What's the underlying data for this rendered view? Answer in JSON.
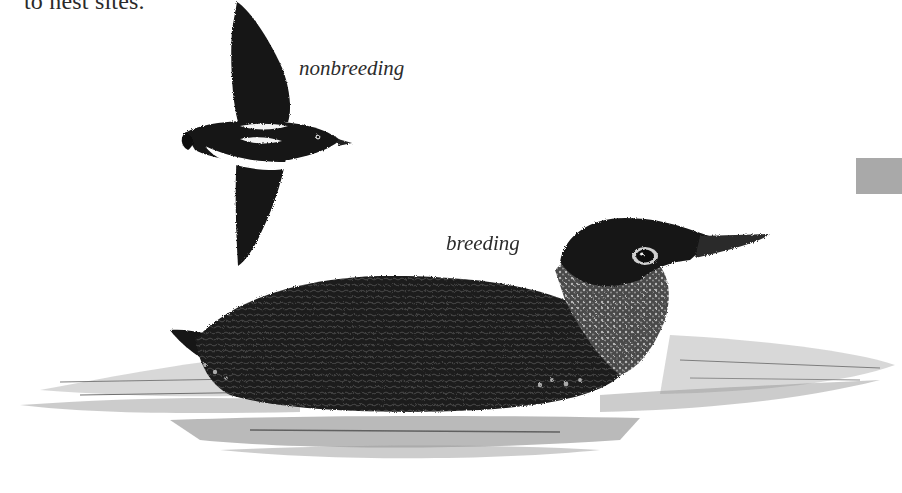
{
  "page": {
    "body_text_fragment": "to nest sites.",
    "thumb_tab_color": "#a9a9a9"
  },
  "illustrations": [
    {
      "id": "flying-bird",
      "caption": "nonbreeding",
      "subject": "alcid in flight, dark upperparts, white underparts, white scapular bar"
    },
    {
      "id": "swimming-bird",
      "caption": "breeding",
      "subject": "alcid swimming on water, dark mottled plumage, speckled throat"
    }
  ],
  "captions": {
    "nonbreeding": "nonbreeding",
    "breeding": "breeding"
  }
}
